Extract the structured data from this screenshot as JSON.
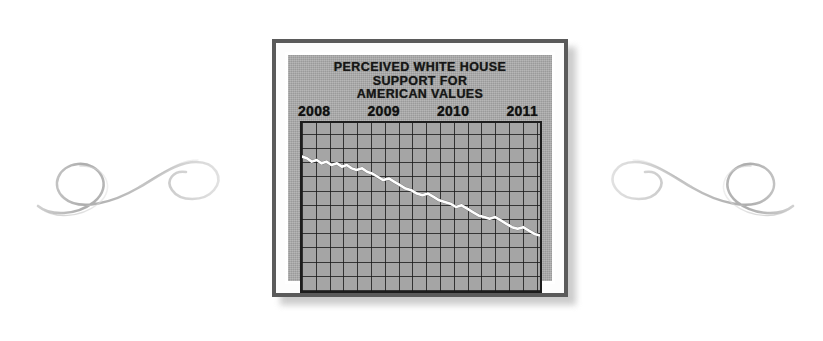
{
  "background": {
    "color": "#ffffff"
  },
  "ornaments": {
    "left": {
      "icon": "swirl-flourish-icon"
    },
    "right": {
      "icon": "swirl-flourish-icon-mirrored"
    }
  },
  "frame": {
    "border_color": "#5b5b5b",
    "mat_color": "#ffffff",
    "card_color": "#a8a8a8"
  },
  "chart_card": {
    "title_lines": [
      "PERCEIVED WHITE HOUSE",
      "SUPPORT FOR",
      "AMERICAN VALUES"
    ],
    "axis_years": [
      "2008",
      "2009",
      "2010",
      "2011"
    ]
  },
  "chart_data": {
    "type": "line",
    "title": "PERCEIVED WHITE HOUSE SUPPORT FOR AMERICAN VALUES",
    "xlabel": "",
    "ylabel": "",
    "grid": true,
    "legend": false,
    "line_color": "#ffffff",
    "plot_background": "#a5a5a5",
    "grid_color": "#1d1d1d",
    "grid_columns": 16,
    "grid_rows": 12,
    "xlim": [
      2008,
      2011.4
    ],
    "ylim": [
      0,
      100
    ],
    "tick_labels": [
      "2008",
      "2009",
      "2010",
      "2011"
    ],
    "x": [
      2008.0,
      2008.07,
      2008.14,
      2008.21,
      2008.28,
      2008.35,
      2008.42,
      2008.5,
      2008.57,
      2008.64,
      2008.71,
      2008.78,
      2008.86,
      2008.93,
      2009.0,
      2009.08,
      2009.16,
      2009.24,
      2009.32,
      2009.4,
      2009.48,
      2009.56,
      2009.64,
      2009.72,
      2009.8,
      2009.88,
      2009.96,
      2010.04,
      2010.12,
      2010.2,
      2010.28,
      2010.36,
      2010.44,
      2010.52,
      2010.6,
      2010.68,
      2010.76,
      2010.84,
      2010.92,
      2011.0,
      2011.08,
      2011.16,
      2011.24,
      2011.32,
      2011.4
    ],
    "values": [
      80,
      79,
      77,
      78,
      76,
      77,
      75,
      76,
      74,
      75,
      73,
      72,
      73,
      71,
      70,
      68,
      66,
      67,
      65,
      63,
      61,
      60,
      58,
      57,
      58,
      56,
      54,
      53,
      52,
      50,
      51,
      49,
      47,
      45,
      44,
      43,
      44,
      42,
      40,
      38,
      37,
      38,
      36,
      34,
      33
    ],
    "annotation": "Steady monotonic decline from 2008 through 2011"
  }
}
